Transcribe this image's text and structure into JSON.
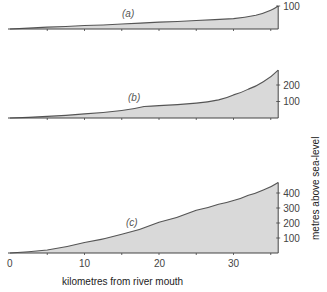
{
  "chart_data": [
    {
      "type": "area",
      "panel_label": "(a)",
      "x": [
        0,
        5,
        10,
        15,
        20,
        25,
        30,
        33,
        35,
        36
      ],
      "values": [
        0,
        8,
        15,
        22,
        30,
        37,
        45,
        60,
        82,
        100
      ],
      "y_ticks": [
        "100"
      ],
      "ylim": [
        0,
        100
      ]
    },
    {
      "type": "area",
      "panel_label": "(b)",
      "x": [
        0,
        5,
        10,
        15,
        18,
        20,
        25,
        28,
        30,
        32,
        34,
        36
      ],
      "values": [
        0,
        10,
        25,
        45,
        70,
        75,
        90,
        110,
        140,
        175,
        220,
        290
      ],
      "y_ticks": [
        "100",
        "200"
      ],
      "ylim": [
        0,
        290
      ]
    },
    {
      "type": "area",
      "panel_label": "(c)",
      "x": [
        0,
        5,
        10,
        15,
        20,
        25,
        28,
        30,
        32,
        34,
        36
      ],
      "values": [
        0,
        20,
        70,
        125,
        205,
        285,
        325,
        350,
        385,
        420,
        470
      ],
      "y_ticks": [
        "100",
        "200",
        "300",
        "400"
      ],
      "ylim": [
        0,
        470
      ]
    }
  ],
  "axes": {
    "x_ticks": [
      "0",
      "10",
      "20",
      "30"
    ],
    "xlabel": "kilometres from river mouth",
    "ylabel": "metres above sea-level"
  },
  "colors": {
    "fill": "#d9d9d9",
    "line": "#555555"
  }
}
